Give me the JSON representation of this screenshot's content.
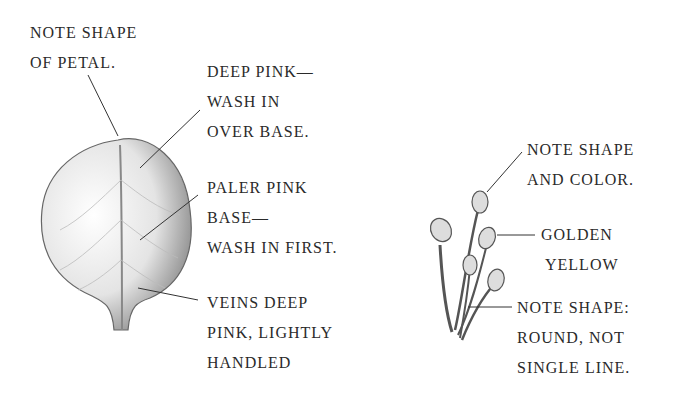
{
  "petal": {
    "labels": [
      {
        "id": "note-shape-petal",
        "lines": [
          "NOTE SHAPE",
          "OF  PETAL."
        ]
      },
      {
        "id": "deep-pink",
        "lines": [
          "DEEP PINK—",
          "WASH IN",
          "OVER BASE."
        ]
      },
      {
        "id": "paler-pink",
        "lines": [
          "PALER PINK",
          "BASE—",
          "WASH IN FIRST."
        ]
      },
      {
        "id": "veins",
        "lines": [
          "VEINS DEEP",
          "PINK, LIGHTLY",
          "HANDLED"
        ]
      }
    ]
  },
  "stamens": {
    "labels": [
      {
        "id": "note-shape-color",
        "lines": [
          "NOTE SHAPE",
          "AND COLOR."
        ]
      },
      {
        "id": "golden-yellow",
        "lines": [
          "GOLDEN",
          "YELLOW"
        ]
      },
      {
        "id": "note-shape-round",
        "lines": [
          "NOTE SHAPE:",
          "ROUND, NOT",
          "SINGLE LINE."
        ]
      }
    ]
  },
  "colors": {
    "ink": "#2a2a2a",
    "sketch": "#555555"
  }
}
